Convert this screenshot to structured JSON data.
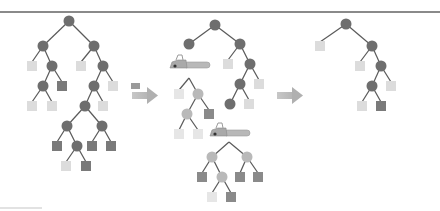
{
  "figure": {
    "caption": "",
    "colors": {
      "internal_node": "#6e6e6e",
      "pruned_node": "#b9b9b9",
      "leaf_light": "#dcdcdc",
      "leaf_dark": "#7a7a7a",
      "edge": "#5a5a5a",
      "arrow": "#a8a8a8",
      "rule": "#8a8a8a"
    },
    "panels": [
      {
        "name": "original-tree",
        "label": ""
      },
      {
        "name": "pruning-step",
        "label": ""
      },
      {
        "name": "pruned-tree",
        "label": ""
      }
    ],
    "icons": [
      "chainsaw-icon",
      "chainsaw-icon",
      "arrow-right-icon",
      "arrow-right-icon"
    ]
  }
}
